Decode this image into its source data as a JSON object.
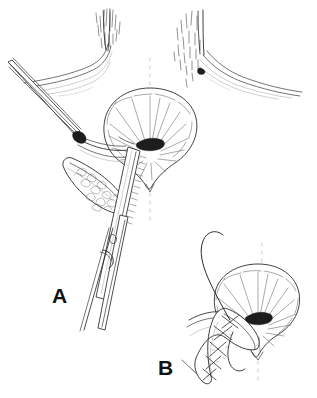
{
  "figure": {
    "background_color": "#ffffff",
    "ink_color": "#2b2b2b",
    "width": 317,
    "height": 398,
    "style": "pen-and-ink medical line drawing"
  },
  "panels": [
    {
      "id": "A",
      "label": "A",
      "label_x": 52,
      "label_y": 303,
      "caption": "",
      "description": "Perineal field with retractor hook elevating tissue, long hemostat clamp in place, and an elliptical incision exposing stippled subcutaneous tissue beside the anal verge",
      "elements": [
        {
          "name": "left-thigh",
          "description": "left thigh / buttock contour with hair stippling"
        },
        {
          "name": "right-thigh",
          "description": "right thigh / buttock contour with hair stippling"
        },
        {
          "name": "anal-verge",
          "description": "radiating anal folds surrounding a dark central orifice"
        },
        {
          "name": "midline-raphe",
          "description": "faint dashed midline above and below the anus"
        },
        {
          "name": "retractor-hook",
          "description": "thin double-line retractor entering from upper left"
        },
        {
          "name": "hemostat-clamp",
          "description": "long clamp with box-lock hinge descending to lower left"
        },
        {
          "name": "incision-flap",
          "description": "open leaf-shaped incision revealing stippled tissue"
        }
      ]
    },
    {
      "id": "B",
      "label": "B",
      "label_x": 158,
      "label_y": 375,
      "caption": "",
      "description": "Close-up of the same perineal field after closure: the flap is sutured with interrupted cross-stitches and a suture thread loops away to the left",
      "elements": [
        {
          "name": "anal-verge",
          "description": "radiating anal folds surrounding a dark central orifice"
        },
        {
          "name": "midline-raphe",
          "description": "faint dashed midline above and below the anus"
        },
        {
          "name": "sutured-flap",
          "description": "leaf-shaped flap closed with cross-hatched interrupted sutures"
        },
        {
          "name": "suture-thread",
          "description": "long curving suture strand sweeping up and to the left"
        },
        {
          "name": "tissue-plane",
          "description": "contour lines of the surrounding skin and subcutaneous plane"
        }
      ]
    }
  ]
}
